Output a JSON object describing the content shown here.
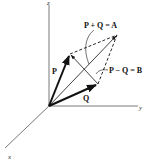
{
  "diagram": {
    "type": "3d-vector-addition-subtraction",
    "axes": {
      "x_label": "x",
      "y_label": "y",
      "z_label": "z"
    },
    "vectors": {
      "P_label": "P",
      "Q_label": "Q"
    },
    "annotations": {
      "sum_label": "P + Q = A",
      "difference_label": "P − Q = B"
    },
    "colors": {
      "ink": "#111111",
      "axis": "#555555",
      "background": "#ffffff"
    }
  }
}
